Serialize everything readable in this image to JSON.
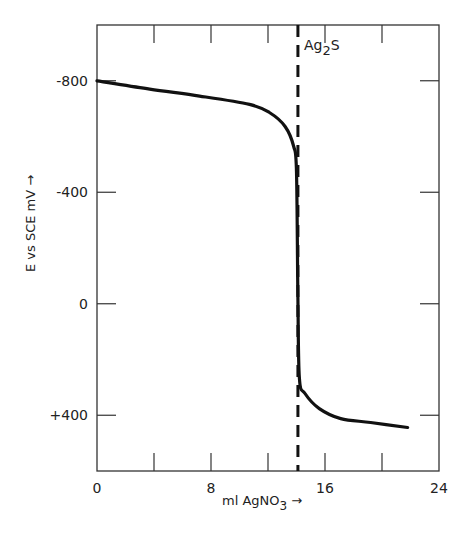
{
  "chart_data": {
    "type": "line",
    "title": "",
    "xlabel": "ml AgNO3",
    "xlabel_parts": {
      "main": "ml AgNO",
      "sub": "3",
      "arrow": "→"
    },
    "ylabel": "E vs SCE mV",
    "ylabel_arrow": "→",
    "xlim": [
      0,
      24
    ],
    "ylim": [
      600,
      -1000
    ],
    "y_inverted": true,
    "grid": false,
    "x_ticks": [
      0,
      4,
      8,
      12,
      16,
      20,
      24
    ],
    "x_tick_labels": [
      {
        "value": 0,
        "label": "0"
      },
      {
        "value": 8,
        "label": "8"
      },
      {
        "value": 16,
        "label": "16"
      },
      {
        "value": 24,
        "label": "24"
      }
    ],
    "y_ticks": [
      {
        "value": -800,
        "label": "-800"
      },
      {
        "value": -400,
        "label": "-400"
      },
      {
        "value": 0,
        "label": "0"
      },
      {
        "value": 400,
        "label": "+400"
      }
    ],
    "series": [
      {
        "name": "titration curve",
        "x": [
          0,
          3.7,
          7.2,
          10.7,
          12.1,
          13.2,
          13.8,
          14.0,
          14.1,
          14.2,
          14.6,
          15.6,
          17.1,
          19.2,
          21.8
        ],
        "y": [
          -800,
          -770,
          -745,
          -715,
          -686,
          -636,
          -564,
          -473,
          -22,
          267,
          322,
          376,
          412,
          426,
          444
        ]
      }
    ],
    "annotations": [
      {
        "type": "vline-dashed",
        "x": 14.1,
        "label": "Ag2S",
        "label_parts": {
          "main": "Ag",
          "sub": "2",
          "tail": "S"
        }
      }
    ]
  }
}
